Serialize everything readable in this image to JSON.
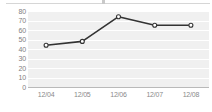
{
  "chart_data": {
    "type": "line",
    "title": "",
    "xlabel": "",
    "ylabel": "",
    "categories": [
      "12/04",
      "12/05",
      "12/06",
      "12/07",
      "12/08"
    ],
    "values": [
      44,
      48,
      74,
      65,
      65
    ],
    "series": [
      {
        "name": "series-1",
        "values": [
          44,
          48,
          74,
          65,
          65
        ]
      }
    ],
    "ylim": [
      0,
      80
    ],
    "ytick_step": 10,
    "yticks": [
      80,
      70,
      60,
      50,
      40,
      30,
      20,
      10,
      0
    ],
    "ytick_labels": [
      "80",
      "70",
      "60",
      "50",
      "40",
      "30",
      "20",
      "10",
      "0"
    ],
    "xtick_labels": [
      "12/04",
      "12/05",
      "12/06",
      "12/07",
      "12/08"
    ],
    "grid": true,
    "grid_axis": "y",
    "legend": false,
    "legend_position": "none",
    "colors": {
      "plot_background": "#f0f0f0",
      "gridline": "#ffffff",
      "line": "#333333",
      "marker_fill": "#ffffff",
      "marker_stroke": "#333333",
      "axis_line": "#b9b9b9",
      "tick_label": "#808080",
      "page_background": "#ffffff"
    },
    "line_width": 1.6,
    "marker": "circle",
    "marker_size": 4
  }
}
